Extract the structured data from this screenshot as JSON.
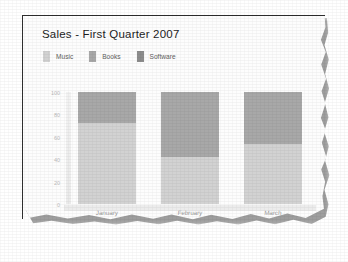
{
  "chart_data": {
    "type": "bar",
    "stacked": true,
    "title": "Sales - First Quarter 2007",
    "categories": [
      "January",
      "February",
      "March"
    ],
    "series": [
      {
        "name": "Music",
        "values": [
          72,
          42,
          54
        ],
        "color": "#d2d2d2"
      },
      {
        "name": "Books",
        "values": [
          28,
          58,
          46
        ],
        "color": "#a8a8a8"
      },
      {
        "name": "Software",
        "values": [
          0,
          0,
          0
        ],
        "color": "#8c8c8c"
      }
    ],
    "xlabel": "",
    "ylabel": "",
    "ylim": [
      0,
      100
    ],
    "yticks": [
      "100",
      "80",
      "60",
      "40",
      "20",
      "0"
    ],
    "grid": false,
    "legend_position": "top-left"
  },
  "legend": {
    "items": [
      {
        "label": "Music"
      },
      {
        "label": "Books"
      },
      {
        "label": "Software"
      }
    ]
  }
}
